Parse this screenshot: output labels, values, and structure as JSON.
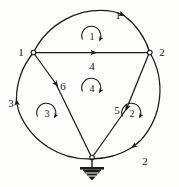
{
  "figure": {
    "type": "circuit-graph",
    "background_color": "#fdfdfc",
    "ink_color": "#1a1a1a"
  },
  "nodes": [
    {
      "id": "node-1",
      "label": "1",
      "x": 33,
      "y": 52,
      "label_x": 21,
      "label_y": 52
    },
    {
      "id": "node-2",
      "label": "2",
      "x": 150,
      "y": 52,
      "label_x": 161,
      "label_y": 52
    },
    {
      "id": "node-ground",
      "label": "",
      "x": 92,
      "y": 158,
      "label_x": 92,
      "label_y": 158
    }
  ],
  "branches": [
    {
      "id": "branch-1",
      "label": "1",
      "kind": "arc",
      "from": "node-1",
      "to": "node-2",
      "label_x": 117,
      "label_y": 17,
      "direction": "clockwise-right"
    },
    {
      "id": "branch-2",
      "label": "2",
      "kind": "arc",
      "from": "node-2",
      "to": "node-ground",
      "label_x": 143,
      "label_y": 160,
      "direction": "down-left"
    },
    {
      "id": "branch-3",
      "label": "3",
      "kind": "arc",
      "from": "node-ground",
      "to": "node-1",
      "label_x": 12,
      "label_y": 104,
      "direction": "up"
    },
    {
      "id": "branch-4",
      "label": "4",
      "kind": "chord",
      "from": "node-1",
      "to": "node-2",
      "label_x": 92,
      "label_y": 70,
      "direction": "right"
    },
    {
      "id": "branch-5",
      "label": "5",
      "kind": "chord",
      "from": "node-2",
      "to": "node-ground",
      "label_x": 118,
      "label_y": 112,
      "direction": "down-left"
    },
    {
      "id": "branch-6",
      "label": "6",
      "kind": "chord",
      "from": "node-1",
      "to": "node-ground",
      "label_x": 62,
      "label_y": 88,
      "direction": "down-right"
    }
  ],
  "meshes": [
    {
      "id": "mesh-1",
      "label": "1",
      "cx": 92,
      "cy": 36,
      "rotation": "clockwise"
    },
    {
      "id": "mesh-2",
      "label": "2",
      "cx": 132,
      "cy": 113,
      "rotation": "clockwise"
    },
    {
      "id": "mesh-3",
      "label": "3",
      "cx": 47,
      "cy": 113,
      "rotation": "clockwise"
    },
    {
      "id": "mesh-4",
      "label": "4",
      "cx": 92,
      "cy": 88,
      "rotation": "clockwise"
    }
  ],
  "ground_symbol": {
    "id": "ground-symbol",
    "name": "ground-earth-symbol",
    "x": 92,
    "y": 158
  },
  "circle": {
    "cx": 90,
    "cy": 90,
    "r": 75
  }
}
